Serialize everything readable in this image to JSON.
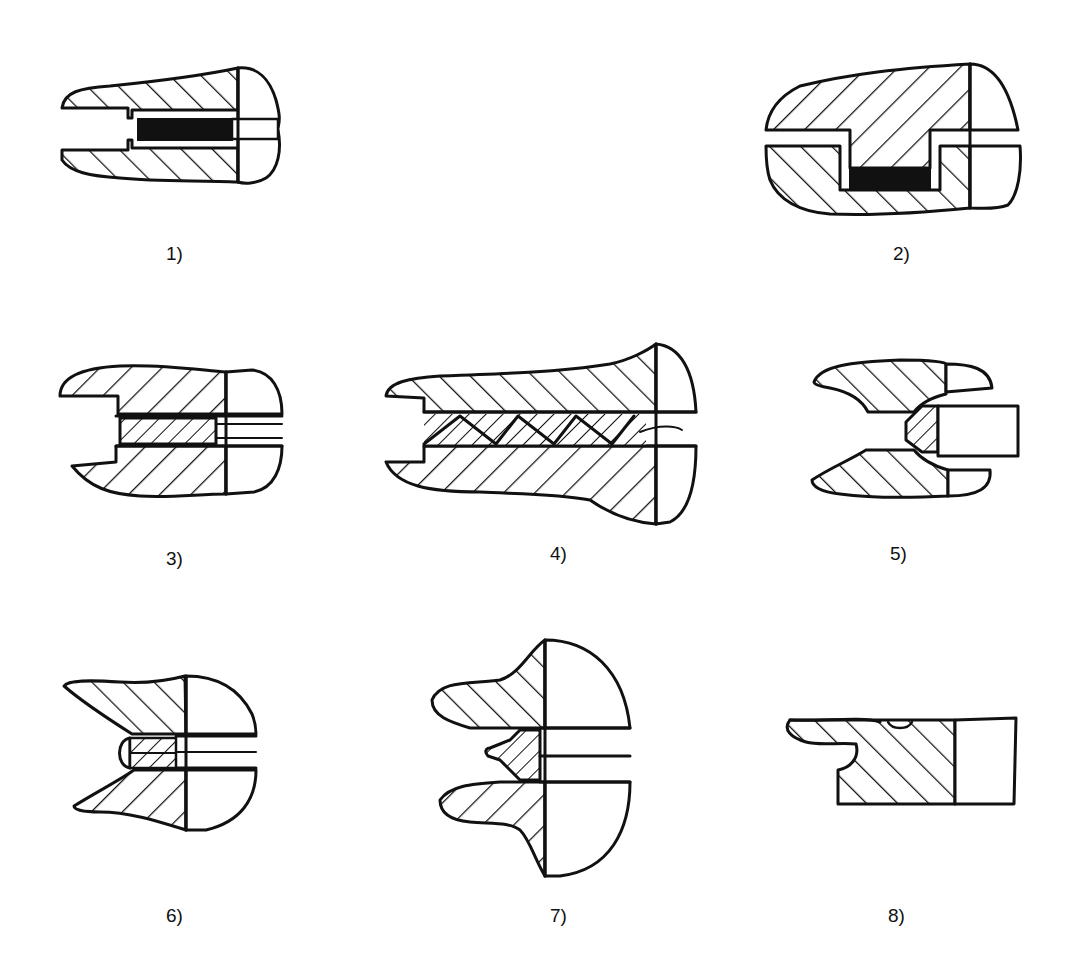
{
  "diagram": {
    "type": "seal cross-sections",
    "figures": [
      {
        "id": 1,
        "label": "1)",
        "description": "Flat gasket (solid black) in straight bore between two hatched parts"
      },
      {
        "id": 2,
        "label": "2)",
        "description": "Tongue-and-groove joint with solid black gasket at groove bottom"
      },
      {
        "id": 3,
        "label": "3)",
        "description": "Straight bore with hatched packing strip"
      },
      {
        "id": 4,
        "label": "4)",
        "description": "Long bore with triangular chevron packing rings"
      },
      {
        "id": 5,
        "label": "5)",
        "description": "Conical seat with trapezoidal hatched seal and plain insert"
      },
      {
        "id": 6,
        "label": "6)",
        "description": "Chevron-layered seal with rounded nose in V-shaped opening"
      },
      {
        "id": 7,
        "label": "7)",
        "description": "Lip seal with chevron layers, flanged housing"
      },
      {
        "id": 8,
        "label": "8)",
        "description": "Single-sided lip seal with undercut"
      }
    ]
  },
  "colors": {
    "line": "#111111",
    "background": "#ffffff"
  }
}
